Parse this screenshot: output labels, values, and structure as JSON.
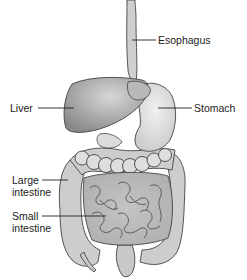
{
  "diagram": {
    "type": "anatomical-illustration",
    "colors": {
      "background": "#ffffff",
      "organ_fill": "#cfcfcf",
      "organ_dark": "#9a9a9a",
      "outline": "#3a3a3a",
      "leader_line": "#222222",
      "text": "#222222"
    },
    "labels": [
      {
        "id": "esophagus",
        "lines": [
          "Esophagus"
        ]
      },
      {
        "id": "liver",
        "lines": [
          "Liver"
        ]
      },
      {
        "id": "stomach",
        "lines": [
          "Stomach"
        ]
      },
      {
        "id": "large-intestine",
        "lines": [
          "Large",
          "intestine"
        ]
      },
      {
        "id": "small-intestine",
        "lines": [
          "Small",
          "intestine"
        ]
      }
    ]
  }
}
